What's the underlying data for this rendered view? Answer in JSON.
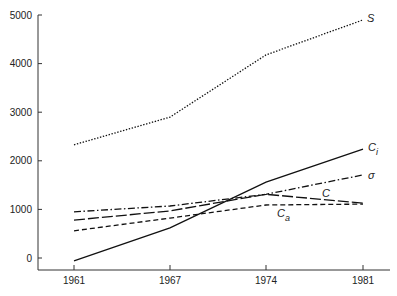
{
  "chart_data": {
    "type": "line",
    "title": "",
    "xlabel": "",
    "ylabel": "",
    "x": [
      "1961",
      "1967",
      "1974",
      "1981"
    ],
    "ylim": [
      -200,
      5000
    ],
    "yticks": [
      0,
      1000,
      2000,
      3000,
      4000,
      5000
    ],
    "ytick_labels": [
      "0",
      "1000",
      "2000",
      "3000",
      "4000",
      "5000"
    ],
    "xtick_labels": [
      "1961",
      "1967",
      "1974",
      "1981"
    ],
    "grid": false,
    "legend": "inline labels at right end of each line",
    "series": [
      {
        "name": "S",
        "label": "S",
        "style": "dotted",
        "values": [
          2330,
          2900,
          4180,
          4900
        ]
      },
      {
        "name": "C_i",
        "label": "C",
        "label_sub": "i",
        "style": "solid",
        "values": [
          -60,
          620,
          1560,
          2240
        ]
      },
      {
        "name": "σ",
        "label": "σ",
        "style": "dash-dot",
        "values": [
          950,
          1070,
          1310,
          1710
        ]
      },
      {
        "name": "C",
        "label": "C",
        "style": "long-dash",
        "values": [
          780,
          970,
          1310,
          1130
        ]
      },
      {
        "name": "C_a",
        "label": "C",
        "label_sub": "a",
        "style": "dashed",
        "values": [
          560,
          820,
          1090,
          1110
        ]
      }
    ]
  }
}
